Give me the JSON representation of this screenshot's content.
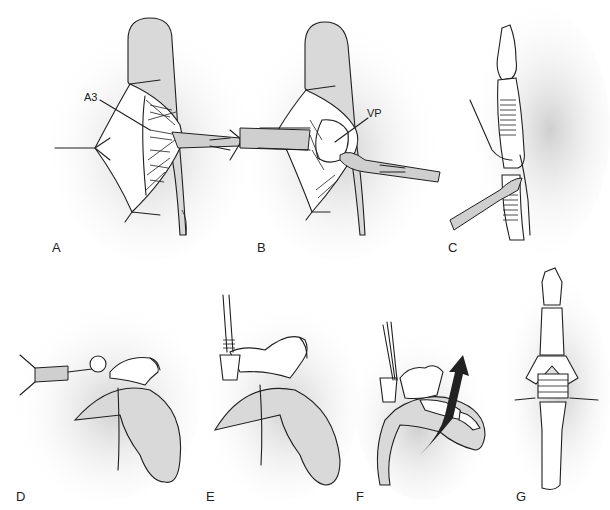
{
  "figure": {
    "panels": [
      {
        "id": "A",
        "label": "A",
        "callouts": [
          {
            "text": "A3"
          }
        ],
        "description": "Digit with palmar incision, A3 pulley exposed, retractor"
      },
      {
        "id": "B",
        "label": "B",
        "callouts": [
          {
            "text": "VP"
          }
        ],
        "description": "Volar plate exposed with retractors and scalpel"
      },
      {
        "id": "C",
        "label": "C",
        "description": "Lateral view of finger bones with instrument at joint"
      },
      {
        "id": "D",
        "label": "D",
        "description": "Flexed finger, burr/drill instrument at joint"
      },
      {
        "id": "E",
        "label": "E",
        "description": "Flexed finger, pin/wire inserted"
      },
      {
        "id": "F",
        "label": "F",
        "description": "Finger extension with arrow indicating motion"
      },
      {
        "id": "G",
        "label": "G",
        "description": "Dorsal view of digit bones with joint implant"
      }
    ],
    "colors": {
      "line": "#1f1f1f",
      "shadow": "#d9d9d9",
      "background": "#ffffff",
      "arrow": "#222222"
    }
  }
}
